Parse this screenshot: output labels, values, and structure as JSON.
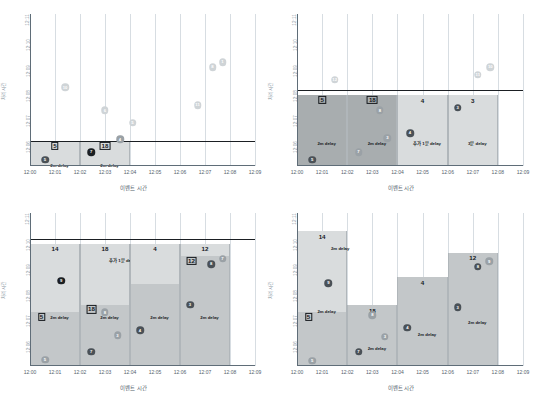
{
  "figure": {
    "panel_count": 4,
    "x_axis_label": "이벤트 시간",
    "y_axis_label": "처리 시간",
    "x_ticks": [
      "12:00",
      "12:01",
      "12:02",
      "12:03",
      "12:04",
      "12:05",
      "12:06",
      "12:07",
      "12:08",
      "12:09"
    ],
    "y_ticks": [
      "12:06",
      "12:07",
      "12:08",
      "12:09",
      "12:10",
      "12:11"
    ],
    "colors": {
      "watermark_line": "#1b1f23",
      "bar_light": "#d9dcdd",
      "bar_mid": "#c3c7c9",
      "bar_dark": "#a8adaf",
      "dot_faint": "#cfd4d7",
      "dot_gray": "#9aa1a6",
      "dot_dark": "#4a5157",
      "dot_black": "#1b1f23",
      "grid": "#d7dde2",
      "axis": "#5f6d78",
      "tick_text": "#54606b"
    }
  },
  "chart_data": [
    {
      "type": "scatter",
      "panel": "top-left",
      "title": "",
      "xlabel": "이벤트 시간",
      "ylabel": "처리 시간",
      "xlim": [
        "12:00",
        "12:09"
      ],
      "ylim": [
        "12:05",
        "12:11"
      ],
      "grid": true,
      "watermark_time": "12:06",
      "points": [
        {
          "label": "10",
          "x": "12:01.4",
          "y": "12:08.1",
          "style": "faint"
        },
        {
          "label": "6",
          "x": "12:03.0",
          "y": "12:07.2",
          "style": "faint"
        },
        {
          "label": "5",
          "x": "12:04.1",
          "y": "12:06.7",
          "style": "faint"
        },
        {
          "label": "11",
          "x": "12:06.7",
          "y": "12:07.4",
          "style": "faint"
        },
        {
          "label": "8",
          "x": "12:07.3",
          "y": "12:08.9",
          "style": "faint"
        },
        {
          "label": "1",
          "x": "12:07.7",
          "y": "12:09.1",
          "style": "faint"
        },
        {
          "label": "4",
          "x": "12:03.6",
          "y": "12:06.05",
          "style": "gray"
        },
        {
          "label": "7",
          "x": "12:02.45",
          "y": "12:05.55",
          "style": "black"
        },
        {
          "label": "5",
          "x": "12:00.6",
          "y": "12:05.25",
          "style": "dark"
        }
      ],
      "windows": [
        {
          "start": "12:00",
          "end": "12:02",
          "top": "12:06",
          "bottom": "12:05",
          "shade": "light",
          "number": "5",
          "boxed": true,
          "delay": "2m delay"
        },
        {
          "start": "12:02",
          "end": "12:04",
          "top": "12:06",
          "bottom": "12:05",
          "shade": "light",
          "number": "18",
          "boxed": true,
          "delay": "2m delay"
        }
      ]
    },
    {
      "type": "bar",
      "panel": "top-right",
      "xlabel": "이벤트 시간",
      "ylabel": "처리 시간",
      "xlim": [
        "12:00",
        "12:09"
      ],
      "ylim": [
        "12:05",
        "12:11"
      ],
      "grid": true,
      "watermark_time": "12:08",
      "windows": [
        {
          "start": "12:00",
          "end": "12:02",
          "top": "12:07.8",
          "bottom": "12:05",
          "shade": "dark",
          "number": "5",
          "boxed": true,
          "delay": "2m delay",
          "result_time": "12:07.0"
        },
        {
          "start": "12:02",
          "end": "12:04",
          "top": "12:07.8",
          "bottom": "12:05",
          "shade": "dark",
          "number": "18",
          "boxed": true,
          "delay": "2m delay",
          "result_time": "12:07.6"
        },
        {
          "start": "12:04",
          "end": "12:06",
          "top": "12:07.8",
          "bottom": "12:05",
          "shade": "light",
          "number": "4",
          "boxed": false,
          "delay": "추가 1분 delay"
        },
        {
          "start": "12:06",
          "end": "12:08",
          "top": "12:07.8",
          "bottom": "12:05",
          "shade": "light",
          "number": "3",
          "boxed": false,
          "delay": "3분 delay"
        }
      ],
      "points": [
        {
          "label": "12",
          "x": "12:01.5",
          "y": "12:08.4",
          "style": "faint"
        },
        {
          "label": "11",
          "x": "12:07.2",
          "y": "12:08.6",
          "style": "faint"
        },
        {
          "label": "10",
          "x": "12:07.7",
          "y": "12:08.9",
          "style": "faint"
        },
        {
          "label": "5",
          "x": "12:00.6",
          "y": "12:05.25",
          "style": "dark"
        },
        {
          "label": "7",
          "x": "12:02.45",
          "y": "12:05.55",
          "style": "gray"
        },
        {
          "label": "8",
          "x": "12:03.3",
          "y": "12:07.2",
          "style": "gray"
        },
        {
          "label": "3",
          "x": "12:03.6",
          "y": "12:06.1",
          "style": "gray"
        },
        {
          "label": "4",
          "x": "12:04.5",
          "y": "12:06.3",
          "style": "dark"
        },
        {
          "label": "3",
          "x": "12:06.4",
          "y": "12:07.3",
          "style": "dark"
        }
      ]
    },
    {
      "type": "bar",
      "panel": "bottom-left",
      "xlabel": "이벤트 시간",
      "ylabel": "처리 시간",
      "xlim": [
        "12:00",
        "12:09"
      ],
      "ylim": [
        "12:05",
        "12:11"
      ],
      "grid": true,
      "watermark_time": "12:10",
      "windows": [
        {
          "start": "12:00",
          "end": "12:02",
          "top": "12:09.8",
          "bottom": "12:05",
          "split": "12:07.1",
          "shade_top": "light",
          "shade_bottom": "mid",
          "number": "14",
          "boxed": false,
          "inner_number": "5",
          "inner_boxed": true,
          "delay": "2m delay"
        },
        {
          "start": "12:02",
          "end": "12:04",
          "top": "12:09.8",
          "bottom": "12:05",
          "split": "12:07.4",
          "shade_top": "light",
          "shade_bottom": "mid",
          "number": "18",
          "boxed": false,
          "inner_number": "18",
          "inner_boxed": true,
          "delay": "2m delay",
          "delay2": "추가 1분 delay"
        },
        {
          "start": "12:04",
          "end": "12:06",
          "top": "12:09.8",
          "bottom": "12:05",
          "split": "12:08.2",
          "shade_top": "light",
          "shade_bottom": "mid",
          "number": "4",
          "boxed": false,
          "delay": "2m delay"
        },
        {
          "start": "12:06",
          "end": "12:08",
          "top": "12:09.8",
          "bottom": "12:05",
          "split": "12:09.3",
          "shade_top": "light",
          "shade_bottom": "mid",
          "number": "12",
          "boxed": false,
          "inner_number": "12",
          "inner_boxed": true,
          "delay": "2m delay"
        }
      ],
      "points": [
        {
          "label": "9",
          "x": "12:01.25",
          "y": "12:08.35",
          "style": "black"
        },
        {
          "label": "5",
          "x": "12:00.6",
          "y": "12:05.25",
          "style": "gray"
        },
        {
          "label": "7",
          "x": "12:02.45",
          "y": "12:05.55",
          "style": "dark"
        },
        {
          "label": "8",
          "x": "12:03.0",
          "y": "12:07.1",
          "style": "gray"
        },
        {
          "label": "3",
          "x": "12:03.5",
          "y": "12:06.2",
          "style": "gray"
        },
        {
          "label": "4",
          "x": "12:04.4",
          "y": "12:06.4",
          "style": "dark"
        },
        {
          "label": "3",
          "x": "12:06.4",
          "y": "12:07.4",
          "style": "dark"
        },
        {
          "label": "8",
          "x": "12:07.25",
          "y": "12:09.0",
          "style": "dark"
        },
        {
          "label": "7",
          "x": "12:07.7",
          "y": "12:09.2",
          "style": "gray"
        }
      ]
    },
    {
      "type": "bar",
      "panel": "bottom-right",
      "xlabel": "이벤트 시간",
      "ylabel": "처리 시간",
      "xlim": [
        "12:00",
        "12:09"
      ],
      "ylim": [
        "12:05",
        "12:11"
      ],
      "grid": true,
      "watermark_time": null,
      "windows": [
        {
          "start": "12:00",
          "end": "12:02",
          "top": "12:10.3",
          "bottom": "12:05",
          "split": "12:07.1",
          "shade_top": "light",
          "shade_bottom": "mid",
          "number": "14",
          "boxed": false,
          "inner_number": "5",
          "inner_boxed": true,
          "delay": "2m delay",
          "delay2": "2m delay"
        },
        {
          "start": "12:02",
          "end": "12:04",
          "top": "12:07.4",
          "bottom": "12:05",
          "shade": "mid",
          "number": "18",
          "boxed": false,
          "delay": "2m delay"
        },
        {
          "start": "12:04",
          "end": "12:06",
          "top": "12:08.5",
          "bottom": "12:05",
          "shade": "mid",
          "number": "4",
          "boxed": false,
          "delay": "2m delay"
        },
        {
          "start": "12:06",
          "end": "12:08",
          "top": "12:09.45",
          "bottom": "12:05",
          "shade": "mid",
          "number": "12",
          "boxed": false,
          "delay": "2m delay"
        }
      ],
      "points": [
        {
          "label": "9",
          "x": "12:01.25",
          "y": "12:08.25",
          "style": "dark"
        },
        {
          "label": "5",
          "x": "12:00.6",
          "y": "12:05.2",
          "style": "gray"
        },
        {
          "label": "7",
          "x": "12:02.45",
          "y": "12:05.55",
          "style": "dark"
        },
        {
          "label": "8",
          "x": "12:03.0",
          "y": "12:07.0",
          "style": "gray"
        },
        {
          "label": "3",
          "x": "12:03.5",
          "y": "12:06.15",
          "style": "gray"
        },
        {
          "label": "4",
          "x": "12:04.4",
          "y": "12:06.5",
          "style": "dark"
        },
        {
          "label": "3",
          "x": "12:06.4",
          "y": "12:07.3",
          "style": "dark"
        },
        {
          "label": "8",
          "x": "12:07.2",
          "y": "12:08.9",
          "style": "dark"
        },
        {
          "label": "9",
          "x": "12:07.65",
          "y": "12:09.1",
          "style": "gray"
        }
      ]
    }
  ]
}
